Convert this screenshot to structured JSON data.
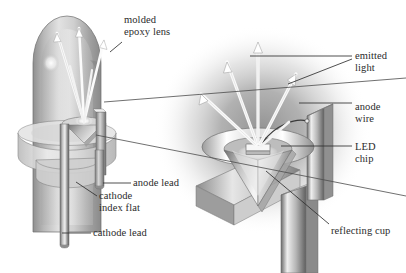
{
  "figure": {
    "background_color": "#ffffff",
    "ink_color": "#2b2b2b",
    "glow_color": "#9a9a9a",
    "views": [
      {
        "name": "full-led-view",
        "description": "Complete LED with molded epoxy dome, flange, leads"
      },
      {
        "name": "magnified-cup-view",
        "description": "Enlarged detail of reflecting cup and LED chip"
      }
    ]
  },
  "labels": [
    {
      "id": "molded-epoxy-lens",
      "line1": "molded",
      "line2": "epoxy lens",
      "x": 124,
      "y": 14,
      "align": "left"
    },
    {
      "id": "emitted-light",
      "line1": "emitted",
      "line2": "light",
      "x": 355,
      "y": 50,
      "align": "left"
    },
    {
      "id": "anode-wire",
      "line1": "anode",
      "line2": "wire",
      "x": 355,
      "y": 101,
      "align": "left"
    },
    {
      "id": "led-chip",
      "line1": "LED",
      "line2": "chip",
      "x": 355,
      "y": 141,
      "align": "left"
    },
    {
      "id": "anode-lead",
      "line1": "anode lead",
      "line2": "",
      "x": 133,
      "y": 180,
      "align": "left"
    },
    {
      "id": "cathode-index-flat",
      "line1": "cathode",
      "line2": "index flat",
      "x": 99,
      "y": 199,
      "align": "left"
    },
    {
      "id": "cathode-lead",
      "line1": "cathode lead",
      "line2": "",
      "x": 93,
      "y": 230,
      "align": "left"
    },
    {
      "id": "reflecting-cup",
      "line1": "reflecting cup",
      "line2": "",
      "x": 331,
      "y": 228,
      "align": "left"
    }
  ],
  "leaders": [
    {
      "id": "leader-molded-epoxy-lens",
      "path": "M122,42 L112,51"
    },
    {
      "id": "leader-emitted-light-a",
      "path": "M353,57 L247,57"
    },
    {
      "id": "leader-emitted-light-b",
      "path": "M353,60 L290,82"
    },
    {
      "id": "leader-anode-wire",
      "path": "M353,103 L298,103"
    },
    {
      "id": "leader-led-chip",
      "path": "M353,146 L283,146"
    },
    {
      "id": "leader-anode-lead",
      "path": "M131,183 L104,183"
    },
    {
      "id": "leader-cathode-index-flat",
      "path": "M97,195 L78,183"
    },
    {
      "id": "leader-cathode-lead",
      "path": "M91,233 L62,233"
    },
    {
      "id": "leader-reflecting-cup",
      "path": "M329,225 L265,172"
    }
  ],
  "callout_lines": [
    {
      "id": "callout-upper",
      "path": "M104,102 L406,78"
    },
    {
      "id": "callout-lower",
      "path": "M96,135 L406,196"
    }
  ],
  "light_rays": {
    "left_view": {
      "count": 4,
      "origin_x": 84,
      "origin_y": 124
    },
    "right_view": {
      "count": 5,
      "origin_x": 258,
      "origin_y": 160
    }
  }
}
